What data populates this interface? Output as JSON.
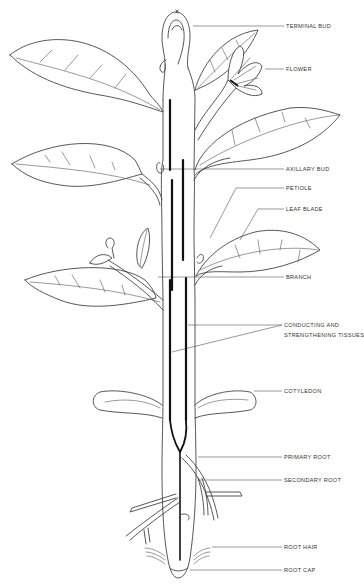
{
  "diagram": {
    "labels": [
      {
        "id": "terminal-bud",
        "text": "TERMINAL BUD",
        "x": 286,
        "y": 24
      },
      {
        "id": "flower",
        "text": "FLOWER",
        "x": 286,
        "y": 67
      },
      {
        "id": "axillary-bud",
        "text": "AXILLARY BUD",
        "x": 286,
        "y": 166
      },
      {
        "id": "petiole",
        "text": "PETIOLE",
        "x": 286,
        "y": 186
      },
      {
        "id": "leaf-blade",
        "text": "LEAF BLADE",
        "x": 286,
        "y": 207
      },
      {
        "id": "branch",
        "text": "BRANCH",
        "x": 286,
        "y": 275
      },
      {
        "id": "conducting-line1",
        "text": "CONDUCTING AND",
        "x": 284,
        "y": 322
      },
      {
        "id": "conducting-line2",
        "text": "STRENGTHENING TISSUES",
        "x": 284,
        "y": 332
      },
      {
        "id": "cotyledon",
        "text": "COTYLEDON",
        "x": 284,
        "y": 389
      },
      {
        "id": "primary-root",
        "text": "PRIMARY ROOT",
        "x": 284,
        "y": 455
      },
      {
        "id": "secondary-root",
        "text": "SECONDARY ROOT",
        "x": 284,
        "y": 479
      },
      {
        "id": "root-hair",
        "text": "ROOT HAIR",
        "x": 284,
        "y": 547
      },
      {
        "id": "root-cap",
        "text": "ROOT CAP",
        "x": 284,
        "y": 570
      }
    ]
  }
}
